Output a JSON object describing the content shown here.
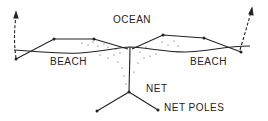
{
  "labels": {
    "ocean": "OCEAN",
    "beach_left": "BEACH",
    "beach_right": "BEACH",
    "net": "NET",
    "net_poles": "NET POLES"
  },
  "colors": {
    "ink": "#222222",
    "background": "#ffffff"
  }
}
